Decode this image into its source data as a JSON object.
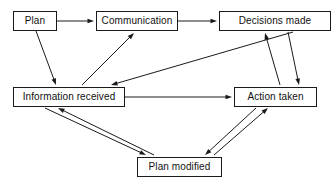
{
  "diagram": {
    "type": "flowchart",
    "background_color": "#ffffff",
    "line_color": "#1a1a1a",
    "text_color": "#111111",
    "nodes": [
      {
        "id": "plan",
        "label": "Plan",
        "x": 13,
        "y": 11,
        "w": 44,
        "h": 20
      },
      {
        "id": "comm",
        "label": "Communication",
        "x": 96,
        "y": 11,
        "w": 82,
        "h": 20
      },
      {
        "id": "decisions",
        "label": "Decisions made",
        "x": 219,
        "y": 11,
        "w": 112,
        "h": 20
      },
      {
        "id": "info",
        "label": "Information received",
        "x": 13,
        "y": 87,
        "w": 112,
        "h": 20
      },
      {
        "id": "action",
        "label": "Action taken",
        "x": 234,
        "y": 87,
        "w": 83,
        "h": 20
      },
      {
        "id": "planmod",
        "label": "Plan modified",
        "x": 137,
        "y": 157,
        "w": 85,
        "h": 20
      }
    ],
    "edges": [
      {
        "id": "plan-to-comm",
        "from": "plan",
        "to": "comm",
        "x1": 57,
        "y1": 21,
        "x2": 94,
        "y2": 21,
        "direction": "one-way"
      },
      {
        "id": "comm-to-decisions",
        "from": "comm",
        "to": "decisions",
        "x1": 178,
        "y1": 21,
        "x2": 217,
        "y2": 21,
        "direction": "one-way"
      },
      {
        "id": "plan-to-info",
        "from": "plan",
        "to": "info",
        "x1": 36,
        "y1": 31,
        "x2": 56,
        "y2": 85,
        "direction": "one-way"
      },
      {
        "id": "info-to-comm",
        "from": "info",
        "to": "comm",
        "x1": 82,
        "y1": 85,
        "x2": 134,
        "y2": 33,
        "direction": "one-way"
      },
      {
        "id": "decisions-to-info",
        "from": "decisions",
        "to": "info",
        "x1": 293,
        "y1": 32,
        "x2": 111,
        "y2": 85,
        "direction": "one-way"
      },
      {
        "id": "info-to-action",
        "from": "info",
        "to": "action",
        "x1": 125,
        "y1": 97,
        "x2": 232,
        "y2": 97,
        "direction": "one-way"
      },
      {
        "id": "action-to-decisions",
        "from": "action",
        "to": "decisions",
        "x1": 280,
        "y1": 85,
        "x2": 265,
        "y2": 33,
        "direction": "one-way"
      },
      {
        "id": "decisions-to-action",
        "from": "decisions",
        "to": "action",
        "x1": 288,
        "y1": 32,
        "x2": 299,
        "y2": 85,
        "direction": "one-way"
      },
      {
        "id": "info-to-planmod",
        "from": "info",
        "to": "planmod",
        "x1": 45,
        "y1": 108,
        "x2": 146,
        "y2": 155,
        "direction": "one-way"
      },
      {
        "id": "planmod-to-info",
        "from": "planmod",
        "to": "info",
        "x1": 154,
        "y1": 155,
        "x2": 58,
        "y2": 108,
        "direction": "one-way"
      },
      {
        "id": "action-to-planmod",
        "from": "action",
        "to": "planmod",
        "x1": 256,
        "y1": 108,
        "x2": 205,
        "y2": 155,
        "direction": "one-way"
      },
      {
        "id": "planmod-to-action",
        "from": "planmod",
        "to": "action",
        "x1": 214,
        "y1": 155,
        "x2": 268,
        "y2": 108,
        "direction": "one-way"
      }
    ]
  }
}
